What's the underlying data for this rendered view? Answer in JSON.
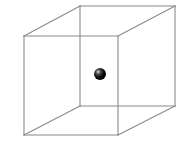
{
  "figure": {
    "type": "wireframe-cube-with-sphere",
    "width": 192,
    "height": 157,
    "background": "#ffffff",
    "edge_color": "#8a8a8a",
    "sphere_color": "#111111",
    "sphere_highlight": "#e8e8e8"
  },
  "cube": {
    "vertices": {
      "front_top_left": [
        24,
        36
      ],
      "front_top_right": [
        118,
        36
      ],
      "front_bottom_left": [
        24,
        135
      ],
      "front_bottom_right": [
        118,
        135
      ],
      "back_top_left": [
        80,
        6
      ],
      "back_top_right": [
        175,
        6
      ],
      "back_bottom_left": [
        80,
        106
      ],
      "back_bottom_right": [
        175,
        106
      ]
    },
    "edges": [
      [
        "front_top_left",
        "front_top_right"
      ],
      [
        "front_top_right",
        "front_bottom_right"
      ],
      [
        "front_bottom_right",
        "front_bottom_left"
      ],
      [
        "front_bottom_left",
        "front_top_left"
      ],
      [
        "back_top_left",
        "back_top_right"
      ],
      [
        "back_top_right",
        "back_bottom_right"
      ],
      [
        "back_bottom_right",
        "back_bottom_left"
      ],
      [
        "back_bottom_left",
        "back_top_left"
      ],
      [
        "front_top_left",
        "back_top_left"
      ],
      [
        "front_top_right",
        "back_top_right"
      ],
      [
        "front_bottom_left",
        "back_bottom_left"
      ],
      [
        "front_bottom_right",
        "back_bottom_right"
      ]
    ]
  },
  "sphere": {
    "center": [
      100,
      74
    ],
    "radius": 6
  }
}
